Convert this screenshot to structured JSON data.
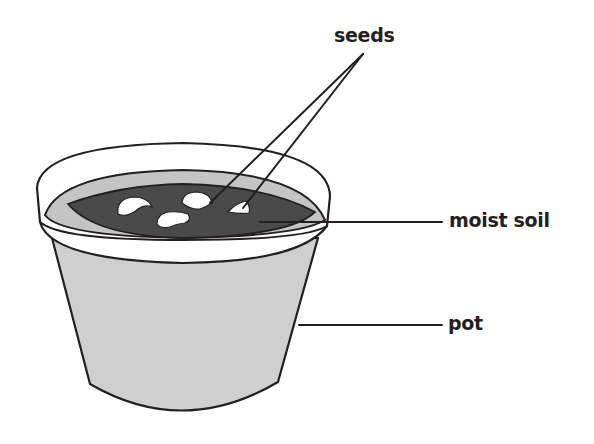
{
  "diagram": {
    "labels": {
      "seeds": "seeds",
      "moist_soil": "moist soil",
      "pot": "pot"
    },
    "colors": {
      "outline": "#231f20",
      "soil": "#4a4a4a",
      "pot_body": "#cfcfcf",
      "rim_inner_wall": "#c4c4c4",
      "rim_band": "#ffffff",
      "seed": "#ffffff",
      "background": "#ffffff"
    },
    "parts": [
      "pot",
      "rim",
      "moist soil",
      "seeds"
    ],
    "seed_count": 4
  }
}
